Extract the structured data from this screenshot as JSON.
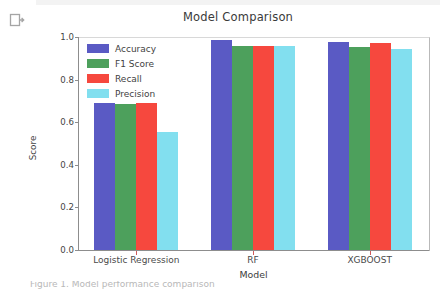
{
  "notebook": {
    "output_indicator_icon": "cell-output-arrow-icon"
  },
  "figure": {
    "caption": "Figure 1. Model performance comparison"
  },
  "chart_data": {
    "type": "bar",
    "title": "Model Comparison",
    "xlabel": "Model",
    "ylabel": "Score",
    "ylim": [
      0.0,
      1.0
    ],
    "grid": false,
    "legend_position": "upper left",
    "categories": [
      "Logistic Regression",
      "RF",
      "XGBOOST"
    ],
    "ytick_labels": [
      "0.0",
      "0.2",
      "0.4",
      "0.6",
      "0.8",
      "1.0"
    ],
    "ytick_values": [
      0.0,
      0.2,
      0.4,
      0.6,
      0.8,
      1.0
    ],
    "series": [
      {
        "name": "Accuracy",
        "color": "#5a5ac4",
        "values": [
          0.705,
          0.985,
          0.975
        ]
      },
      {
        "name": "F1 Score",
        "color": "#4da05c",
        "values": [
          0.685,
          0.96,
          0.955
        ]
      },
      {
        "name": "Recall",
        "color": "#f6483e",
        "values": [
          0.705,
          0.96,
          0.97
        ]
      },
      {
        "name": "Precision",
        "color": "#82dfef",
        "values": [
          0.555,
          0.96,
          0.945
        ]
      }
    ]
  }
}
